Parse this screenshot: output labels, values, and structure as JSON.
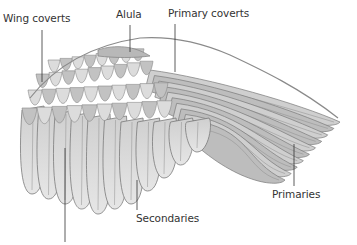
{
  "diagram": {
    "labels": [
      {
        "id": "wing-coverts",
        "text": "Wing coverts"
      },
      {
        "id": "alula",
        "text": "Alula"
      },
      {
        "id": "primary-coverts",
        "text": "Primary coverts"
      },
      {
        "id": "primaries",
        "text": "Primaries"
      },
      {
        "id": "secondaries",
        "text": "Secondaries"
      }
    ],
    "colors": {
      "background": "#ffffff",
      "feather_light": "#e4e4e4",
      "feather_mid": "#c4c4c4",
      "feather_dark": "#9a9a9a",
      "outline": "#7a7a7a",
      "leader_line": "#333333",
      "label_text": "#333333"
    }
  }
}
